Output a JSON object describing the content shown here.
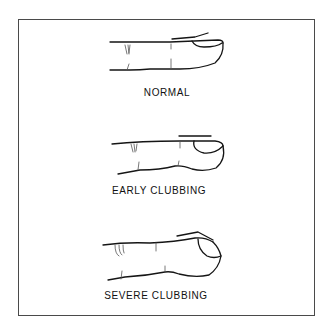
{
  "diagram": {
    "title": "",
    "colors": {
      "ink": "#151515",
      "border": "#4a4a4a",
      "background": "#ffffff"
    },
    "panels": [
      {
        "id": "normal",
        "label": "NORMAL",
        "stage": "normal"
      },
      {
        "id": "early",
        "label": "EARLY CLUBBING",
        "stage": "early-clubbing"
      },
      {
        "id": "severe",
        "label": "SEVERE CLUBBING",
        "stage": "severe-clubbing"
      }
    ]
  }
}
